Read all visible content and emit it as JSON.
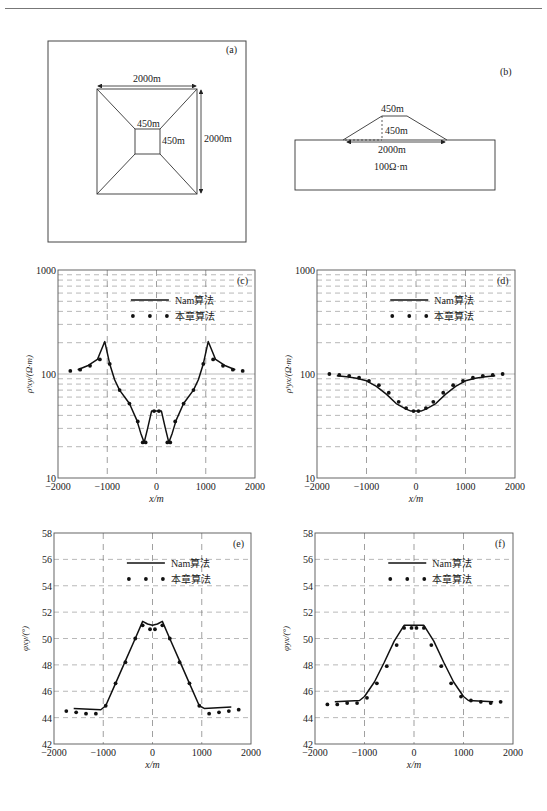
{
  "diagrams": {
    "a": {
      "label": "(a)",
      "outer_width": "2000m",
      "outer_height": "2000m",
      "inner_width": "450m",
      "inner_height": "450m"
    },
    "b": {
      "label": "(b)",
      "top_width": "450m",
      "height": "450m",
      "base_width": "2000m",
      "resistivity": "100Ω·m"
    }
  },
  "legend": {
    "line_label": "Nam算法",
    "dots_label": "本章算法"
  },
  "chart_data": [
    {
      "id": "c",
      "panel_label": "(c)",
      "type": "line",
      "yscale": "log",
      "xlabel": "x/m",
      "ylabel": "ρˢxy/(Ω·m)",
      "xlim": [
        -2000,
        2000
      ],
      "ylim": [
        10,
        1000
      ],
      "xticks": [
        -2000,
        -1000,
        0,
        1000,
        2000
      ],
      "xtick_labels": [
        "−2000",
        "−1000",
        "0",
        "1000",
        "2000"
      ],
      "yticks": [
        10,
        100,
        1000
      ],
      "ytick_labels": [
        "10",
        "100",
        "1000"
      ],
      "grid": true,
      "legend_position": "top-center",
      "series": [
        {
          "name": "Nam算法",
          "style": "line",
          "x": [
            -1600,
            -1400,
            -1200,
            -1050,
            -950,
            -850,
            -750,
            -550,
            -400,
            -320,
            -250,
            -180,
            -100,
            0,
            100,
            180,
            250,
            320,
            400,
            550,
            750,
            850,
            950,
            1050,
            1200,
            1400,
            1600
          ],
          "y": [
            110,
            120,
            138,
            205,
            125,
            88,
            70,
            52,
            36,
            27,
            22,
            30,
            44,
            44,
            44,
            30,
            22,
            27,
            36,
            52,
            70,
            88,
            125,
            205,
            138,
            120,
            110
          ]
        },
        {
          "name": "本章算法",
          "style": "dots",
          "x": [
            -1750,
            -1550,
            -1350,
            -1150,
            -950,
            -750,
            -550,
            -380,
            -280,
            -220,
            -50,
            50,
            220,
            280,
            380,
            550,
            750,
            950,
            1150,
            1350,
            1550,
            1750
          ],
          "y": [
            107,
            110,
            120,
            138,
            125,
            70,
            52,
            35,
            22,
            22,
            44,
            44,
            22,
            22,
            35,
            52,
            70,
            125,
            138,
            120,
            110,
            107
          ]
        }
      ]
    },
    {
      "id": "d",
      "panel_label": "(d)",
      "type": "line",
      "yscale": "log",
      "xlabel": "x/m",
      "ylabel": "ρˢyx/(Ω·m)",
      "xlim": [
        -2000,
        2000
      ],
      "ylim": [
        10,
        1000
      ],
      "xticks": [
        -2000,
        -1000,
        0,
        1000,
        2000
      ],
      "xtick_labels": [
        "−2000",
        "−1000",
        "0",
        "1000",
        "2000"
      ],
      "yticks": [
        10,
        100,
        1000
      ],
      "ytick_labels": [
        "10",
        "100",
        "1000"
      ],
      "grid": true,
      "legend_position": "top-center",
      "series": [
        {
          "name": "Nam算法",
          "style": "line",
          "x": [
            -1600,
            -1400,
            -1200,
            -1000,
            -800,
            -600,
            -400,
            -200,
            -100,
            0,
            100,
            200,
            400,
            600,
            800,
            1000,
            1200,
            1400,
            1600
          ],
          "y": [
            96,
            94,
            91,
            86,
            76,
            64,
            52,
            46,
            44,
            44,
            44,
            46,
            52,
            64,
            76,
            86,
            91,
            94,
            96
          ]
        },
        {
          "name": "本章算法",
          "style": "dots",
          "x": [
            -1750,
            -1550,
            -1350,
            -1150,
            -950,
            -750,
            -550,
            -350,
            -200,
            -50,
            50,
            200,
            350,
            550,
            750,
            950,
            1150,
            1350,
            1550,
            1750
          ],
          "y": [
            100,
            98,
            96,
            92,
            86,
            78,
            66,
            54,
            47,
            44,
            44,
            47,
            54,
            66,
            78,
            86,
            92,
            96,
            98,
            100
          ]
        }
      ]
    },
    {
      "id": "e",
      "panel_label": "(e)",
      "type": "line",
      "yscale": "linear",
      "xlabel": "x/m",
      "ylabel": "φxy/(°)",
      "xlim": [
        -2000,
        2000
      ],
      "ylim": [
        42,
        58
      ],
      "xticks": [
        -2000,
        -1000,
        0,
        1000,
        2000
      ],
      "xtick_labels": [
        "−2000",
        "−1000",
        "0",
        "1000",
        "2000"
      ],
      "yticks": [
        42,
        44,
        46,
        48,
        50,
        52,
        54,
        56,
        58
      ],
      "ytick_labels": [
        "42",
        "44",
        "46",
        "48",
        "50",
        "52",
        "54",
        "56",
        "58"
      ],
      "grid": true,
      "legend_position": "top-center",
      "series": [
        {
          "name": "Nam算法",
          "style": "line",
          "x": [
            -1600,
            -1050,
            -950,
            -750,
            -550,
            -350,
            -200,
            -100,
            0,
            100,
            200,
            350,
            550,
            750,
            950,
            1050,
            1600
          ],
          "y": [
            44.7,
            44.6,
            44.9,
            46.6,
            48.3,
            50.0,
            51.3,
            51.1,
            51.0,
            51.1,
            51.3,
            50.0,
            48.3,
            46.6,
            44.9,
            44.7,
            44.8
          ]
        },
        {
          "name": "本章算法",
          "style": "dots",
          "x": [
            -1750,
            -1550,
            -1350,
            -1150,
            -950,
            -750,
            -550,
            -350,
            -200,
            -50,
            50,
            200,
            350,
            550,
            750,
            950,
            1150,
            1350,
            1550,
            1750
          ],
          "y": [
            44.5,
            44.4,
            44.3,
            44.3,
            44.9,
            46.6,
            48.2,
            50.0,
            51.0,
            50.7,
            50.7,
            51.0,
            50.0,
            48.2,
            46.6,
            44.9,
            44.3,
            44.4,
            44.5,
            44.6
          ]
        }
      ]
    },
    {
      "id": "f",
      "panel_label": "(f)",
      "type": "line",
      "yscale": "linear",
      "xlabel": "x/m",
      "ylabel": "φyx/(°)",
      "xlim": [
        -2000,
        2000
      ],
      "ylim": [
        42,
        58
      ],
      "xticks": [
        -2000,
        -1000,
        0,
        1000,
        2000
      ],
      "xtick_labels": [
        "−2000",
        "−1000",
        "0",
        "1000",
        "2000"
      ],
      "yticks": [
        42,
        44,
        46,
        48,
        50,
        52,
        54,
        56,
        58
      ],
      "ytick_labels": [
        "42",
        "44",
        "46",
        "48",
        "50",
        "52",
        "54",
        "56",
        "58"
      ],
      "grid": true,
      "legend_position": "top-center",
      "series": [
        {
          "name": "Nam算法",
          "style": "line",
          "x": [
            -1600,
            -1100,
            -1000,
            -800,
            -600,
            -400,
            -200,
            -100,
            0,
            100,
            200,
            400,
            600,
            800,
            1000,
            1100,
            1600
          ],
          "y": [
            45.2,
            45.3,
            45.6,
            46.7,
            48.2,
            49.8,
            51.0,
            51.0,
            51.0,
            51.0,
            51.0,
            49.8,
            48.2,
            46.7,
            45.6,
            45.3,
            45.2
          ]
        },
        {
          "name": "本章算法",
          "style": "dots",
          "x": [
            -1750,
            -1550,
            -1350,
            -1150,
            -950,
            -750,
            -550,
            -350,
            -200,
            -50,
            50,
            200,
            350,
            550,
            750,
            950,
            1150,
            1350,
            1550,
            1750
          ],
          "y": [
            45.0,
            45.0,
            45.1,
            45.1,
            45.5,
            46.6,
            47.9,
            49.5,
            50.8,
            50.8,
            50.8,
            50.8,
            49.5,
            47.9,
            46.6,
            45.6,
            45.3,
            45.2,
            45.1,
            45.2
          ]
        }
      ]
    }
  ]
}
